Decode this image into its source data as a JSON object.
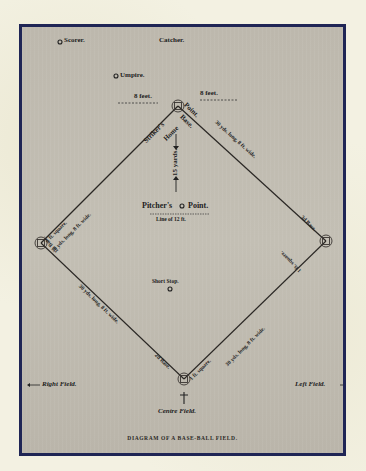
{
  "diagram": {
    "caption": "DIAGRAM OF A BASE-BALL FIELD.",
    "colors": {
      "frame": "#1f2555",
      "plate": "#bfbaaf",
      "page": "#f3f1e2",
      "ink": "#1e1c1a"
    },
    "positions": {
      "scorer": "Scorer.",
      "catcher": "Catcher.",
      "umpire": "Umpire.",
      "pitcher": "Pitcher's",
      "pitcher_point": "Point.",
      "line_of": "Line of 12 ft.",
      "short_stop": "Short Stop.",
      "right_field": "Right Field.",
      "left_field": "Left Field.",
      "centre_field": "Centre Field."
    },
    "bases": {
      "home_striker": "Striker's",
      "home_home": "Home",
      "home_point": "Point.",
      "home_base": "Base.",
      "first": "1st Base.",
      "second": "2d Base.",
      "third": "3d Base."
    },
    "measurements": {
      "left_feet": "8 feet.",
      "right_feet": "8 feet.",
      "pitch_distance": "15 yards.",
      "path_home_first": "30 yds. long, 8 ft. wide.",
      "path_home_third": "30 yds. long, 8 ft. wide.",
      "path_first_second": "30 yds. long, 8 ft. wide.",
      "path_third_second": "30 yds. long, 8 ft. wide.",
      "square_first": "1 ft. square.",
      "square_third": "1 ft. square.",
      "square_second": "1 ft. square."
    }
  }
}
